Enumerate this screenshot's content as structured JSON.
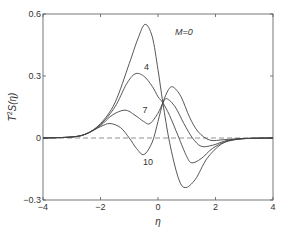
{
  "chart_data": {
    "type": "line",
    "title": "",
    "xlabel": "η",
    "ylabel": "T²S(η)",
    "xlim": [
      -4,
      4
    ],
    "ylim": [
      -0.3,
      0.6
    ],
    "xticks": [
      -4,
      -2,
      0,
      2,
      4
    ],
    "yticks": [
      -0.3,
      0,
      0.3,
      0.6
    ],
    "xtick_labels": [
      "−4",
      "−2",
      "0",
      "2",
      "4"
    ],
    "ytick_labels": [
      "−0.3",
      "0",
      "0.3",
      "0.6"
    ],
    "grid": false,
    "legend": "inline labels",
    "reference_line": {
      "y": 0,
      "style": "dashed"
    },
    "annotations": [
      {
        "text": "M=0",
        "x": 0.9,
        "y": 0.5
      },
      {
        "text": "4",
        "x": -0.4,
        "y": 0.33
      },
      {
        "text": "7",
        "x": -0.45,
        "y": 0.12
      },
      {
        "text": "10",
        "x": -0.35,
        "y": -0.13
      }
    ],
    "series": [
      {
        "name": "M=0",
        "x": [
          -4,
          -3,
          -2.5,
          -2,
          -1.5,
          -1,
          -0.7,
          -0.45,
          -0.2,
          0,
          0.17,
          0.4,
          0.7,
          0.94,
          1.3,
          1.7,
          2.2,
          2.7,
          3.2,
          4
        ],
        "y": [
          0,
          0.005,
          0.02,
          0.07,
          0.17,
          0.36,
          0.48,
          0.55,
          0.49,
          0.33,
          0.17,
          -0.02,
          -0.19,
          -0.24,
          -0.2,
          -0.1,
          -0.03,
          -0.008,
          -0.002,
          0
        ]
      },
      {
        "name": "M=4",
        "x": [
          -4,
          -3,
          -2.5,
          -2,
          -1.5,
          -1.1,
          -0.8,
          -0.5,
          -0.2,
          0,
          0.17,
          0.4,
          0.7,
          1.0,
          1.18,
          1.5,
          1.9,
          2.4,
          3,
          4
        ],
        "y": [
          0,
          0.005,
          0.02,
          0.065,
          0.15,
          0.26,
          0.31,
          0.3,
          0.25,
          0.2,
          0.17,
          0.11,
          0.01,
          -0.09,
          -0.12,
          -0.1,
          -0.05,
          -0.015,
          -0.003,
          0
        ]
      },
      {
        "name": "M=7",
        "x": [
          -4,
          -3,
          -2.5,
          -2,
          -1.6,
          -1.15,
          -0.8,
          -0.5,
          -0.28,
          0,
          0.17,
          0.31,
          0.6,
          0.9,
          1.2,
          1.5,
          1.9,
          2.4,
          3,
          4
        ],
        "y": [
          0,
          0.005,
          0.02,
          0.06,
          0.11,
          0.135,
          0.11,
          0.08,
          0.07,
          0.12,
          0.17,
          0.19,
          0.15,
          0.07,
          0.0,
          -0.04,
          -0.035,
          -0.012,
          -0.003,
          0
        ]
      },
      {
        "name": "M=10",
        "x": [
          -4,
          -3,
          -2.5,
          -2,
          -1.67,
          -1.3,
          -1,
          -0.75,
          -0.49,
          -0.2,
          0,
          0.17,
          0.35,
          0.52,
          0.8,
          1.1,
          1.4,
          1.8,
          2.3,
          3,
          4
        ],
        "y": [
          0,
          0.005,
          0.02,
          0.055,
          0.07,
          0.05,
          0.0,
          -0.05,
          -0.08,
          -0.02,
          0.08,
          0.17,
          0.23,
          0.247,
          0.2,
          0.1,
          0.03,
          -0.01,
          -0.008,
          -0.002,
          0
        ]
      }
    ]
  },
  "labels": {
    "xlabel": "η",
    "ylabel_T": "T",
    "ylabel_sup": "2",
    "ylabel_rest": "S(η)",
    "curve_M0": "M=0",
    "curve_M4": "4",
    "curve_M7": "7",
    "curve_M10": "10"
  }
}
